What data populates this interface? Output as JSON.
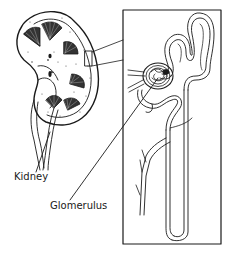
{
  "diagram": {
    "labels": {
      "kidney": "Kidney",
      "glomerulus": "Glomerulus"
    },
    "colors": {
      "ink": "#1a1a1a",
      "background": "#ffffff",
      "stipple": "#555555"
    },
    "parts": [
      "kidney-cross-section",
      "inset-box",
      "nephron",
      "glomerulus",
      "blood-vessels",
      "collecting-duct"
    ]
  }
}
